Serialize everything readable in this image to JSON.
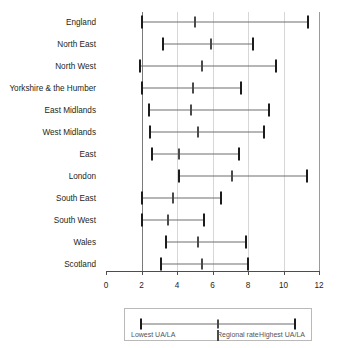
{
  "chart_data": {
    "type": "bar",
    "subtype": "range-with-marker",
    "title": "",
    "xlabel": "",
    "ylabel": "",
    "xlim": [
      0,
      12
    ],
    "xticks": [
      0,
      2,
      4,
      6,
      8,
      10,
      12
    ],
    "xtick_labels": [
      "0",
      "2",
      "4",
      "6",
      "8",
      "10",
      "12"
    ],
    "grid": "vertical",
    "legend_position": "below-axis",
    "categories": [
      "England",
      "North East",
      "North West",
      "Yorkshire & the Humber",
      "East Midlands",
      "West Midlands",
      "East",
      "London",
      "South East",
      "South West",
      "Wales",
      "Scotland"
    ],
    "series": [
      {
        "name": "Lowest UA/LA",
        "values": [
          2.0,
          3.2,
          1.9,
          2.0,
          2.4,
          2.5,
          2.6,
          4.1,
          2.0,
          2.0,
          3.4,
          3.1
        ]
      },
      {
        "name": "Regional rate",
        "values": [
          5.0,
          5.9,
          5.4,
          4.9,
          4.8,
          5.2,
          4.1,
          7.1,
          3.8,
          3.5,
          5.2,
          5.4
        ]
      },
      {
        "name": "Highest UA/LA",
        "values": [
          11.4,
          8.3,
          9.6,
          7.6,
          9.2,
          8.9,
          7.5,
          11.3,
          6.5,
          5.5,
          7.9,
          8.0
        ]
      }
    ],
    "rows": [
      {
        "label": "England",
        "low": 2.0,
        "mid": 5.0,
        "high": 11.4
      },
      {
        "label": "North East",
        "low": 3.2,
        "mid": 5.9,
        "high": 8.3
      },
      {
        "label": "North West",
        "low": 1.9,
        "mid": 5.4,
        "high": 9.6
      },
      {
        "label": "Yorkshire & the Humber",
        "low": 2.0,
        "mid": 4.9,
        "high": 7.6
      },
      {
        "label": "East Midlands",
        "low": 2.4,
        "mid": 4.8,
        "high": 9.2
      },
      {
        "label": "West Midlands",
        "low": 2.5,
        "mid": 5.2,
        "high": 8.9
      },
      {
        "label": "East",
        "low": 2.6,
        "mid": 4.1,
        "high": 7.5
      },
      {
        "label": "London",
        "low": 4.1,
        "mid": 7.1,
        "high": 11.3
      },
      {
        "label": "South East",
        "low": 2.0,
        "mid": 3.8,
        "high": 6.5
      },
      {
        "label": "South West",
        "low": 2.0,
        "mid": 3.5,
        "high": 5.5
      },
      {
        "label": "Wales",
        "low": 3.4,
        "mid": 5.2,
        "high": 7.9
      },
      {
        "label": "Scotland",
        "low": 3.1,
        "mid": 5.4,
        "high": 8.0
      }
    ],
    "legend": {
      "low_label": "Lowest UA/LA",
      "mid_label": "Regional rate",
      "high_label": "Highest UA/LA"
    },
    "colors": {
      "cap": "#1c1c1c",
      "mid_marker": "#4a4a4a",
      "line": "#6f6f6f",
      "grid": "#d7d7d7",
      "axis": "#4d4d4d",
      "text": "#231f20",
      "legend_text": "#545454",
      "background": "#ffffff"
    }
  }
}
